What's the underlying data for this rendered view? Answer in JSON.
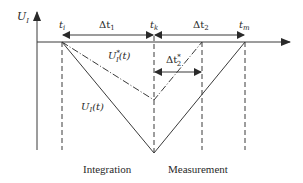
{
  "diagram": {
    "y_axis_label": "U",
    "y_axis_sub": "I",
    "time_markers": [
      {
        "id": "ti",
        "label": "t",
        "sub": "i"
      },
      {
        "id": "tk",
        "label": "t",
        "sub": "k"
      },
      {
        "id": "tm",
        "label": "t",
        "sub": "m"
      }
    ],
    "intervals": [
      {
        "id": "dt1",
        "label": "Δt",
        "sub": "1"
      },
      {
        "id": "dt2",
        "label": "Δt",
        "sub": "2"
      },
      {
        "id": "dt2star",
        "label": "Δt",
        "sub": "2",
        "sup": "*"
      }
    ],
    "curves": [
      {
        "id": "UI",
        "label": "U",
        "sub": "I",
        "arg": "(t)",
        "style": "solid"
      },
      {
        "id": "UIstar",
        "label": "U",
        "sub": "I",
        "sup": "*",
        "arg": "(t)",
        "style": "dash-dot"
      }
    ],
    "phases": {
      "integration": "Integration",
      "measurement": "Measurement"
    },
    "colors": {
      "line": "#3a3a3a",
      "background": "#ffffff"
    }
  }
}
